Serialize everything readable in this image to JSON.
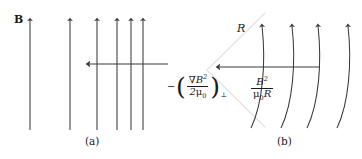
{
  "figure": {
    "background_color": "#ffffff",
    "line_color": "#3a3a3a",
    "guide_color": "#e0e0e0",
    "text_color": "#1a1a1a",
    "width": 362,
    "height": 159
  },
  "panel_a": {
    "caption": "(a)",
    "field_label": "B",
    "force_label": {
      "minus": "−",
      "paren_open": "(",
      "numerator_nabla": "∇",
      "numerator_symbol": "B",
      "numerator_exponent": "2",
      "denominator_coef": "2",
      "denominator_mu": "μ",
      "denominator_sub": "0",
      "paren_close": ")",
      "perp": "⊥",
      "plain": "−(∇B²/2μ₀)⊥"
    },
    "field_lines_x": [
      30,
      70,
      97,
      117,
      131,
      143
    ],
    "field_line_top": 16,
    "field_line_bottom": 130,
    "force_arrow": {
      "x_start": 168,
      "x_end": 85,
      "y": 64,
      "direction": "left"
    }
  },
  "panel_b": {
    "caption": "(b)",
    "radius_label": "R",
    "force_label": {
      "numerator_symbol": "B",
      "numerator_exponent": "2",
      "denominator_mu": "μ",
      "denominator_sub": "0",
      "denominator_radius": "R",
      "plain": "B²/μ₀R"
    },
    "arc_count": 4,
    "wedge_apex": {
      "x": 207,
      "y": 70
    },
    "force_arrow": {
      "x_start": 320,
      "x_end": 215,
      "y": 67,
      "direction": "left"
    }
  }
}
